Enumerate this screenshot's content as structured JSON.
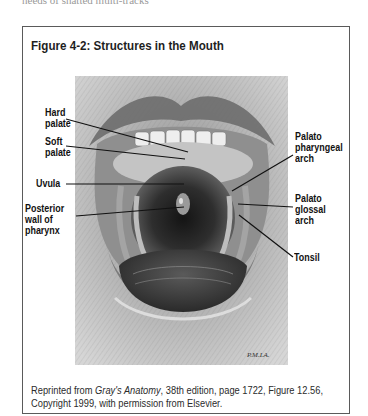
{
  "page": {
    "cut_text_fragment": "needs of shatted multi-tracks"
  },
  "figure": {
    "title": "Figure 4-2: Structures in the Mouth",
    "illustration": {
      "description": "Pencil drawing of an open mouth showing oral cavity structures",
      "artist_signature": "P.M.LA."
    },
    "labels": {
      "hard_palate": [
        "Hard",
        "palate"
      ],
      "soft_palate": [
        "Soft",
        "palate"
      ],
      "uvula": [
        "Uvula"
      ],
      "posterior_wall": [
        "Posterior",
        "wall of",
        "pharynx"
      ],
      "palatopharyngeal": [
        "Palato",
        "pharyngeal",
        "arch"
      ],
      "palatoglossal": [
        "Palato",
        "glossal",
        "arch"
      ],
      "tonsil": [
        "Tonsil"
      ]
    },
    "caption": {
      "prefix": "Reprinted from ",
      "source_title": "Gray's Anatomy",
      "line1_rest": ", 38th edition, page 1722, Figure 12.56,",
      "line2": "Copyright 1999, with permission from Elsevier."
    }
  },
  "colors": {
    "border": "#5a5a5a",
    "text": "#1a1a1a",
    "leader_line": "#111111"
  }
}
